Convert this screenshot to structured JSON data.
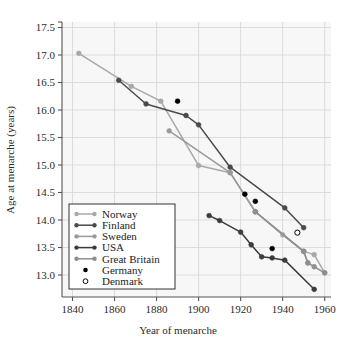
{
  "chart_data": {
    "type": "line",
    "title": "",
    "xlabel": "Year of menarche",
    "ylabel": "Age at menarche (years)",
    "xlim": [
      1835,
      1963
    ],
    "ylim": [
      12.6,
      17.6
    ],
    "xticks": [
      1840,
      1860,
      1880,
      1900,
      1920,
      1940,
      1960
    ],
    "yticks": [
      13.0,
      13.5,
      14.0,
      14.5,
      15.0,
      15.5,
      16.0,
      16.5,
      17.5
    ],
    "ytick_labels": [
      "13.0",
      "13.5",
      "14.0",
      "14.5",
      "15.0",
      "15.5",
      "16.0",
      "16.5",
      "17.0",
      "17.5"
    ],
    "ytick_values": [
      13.0,
      13.5,
      14.0,
      14.5,
      15.0,
      15.5,
      16.0,
      16.5,
      17.0,
      17.5
    ],
    "grid": true,
    "legend_position": "lower-left",
    "series": [
      {
        "name": "Norway",
        "color": "#a8a8a8",
        "marker": "filled-circle",
        "line": true,
        "points": [
          {
            "x": 1843,
            "y": 17.03
          },
          {
            "x": 1868,
            "y": 16.43
          },
          {
            "x": 1882,
            "y": 16.16
          },
          {
            "x": 1900,
            "y": 14.99
          },
          {
            "x": 1915,
            "y": 14.86
          },
          {
            "x": 1927,
            "y": 14.15
          },
          {
            "x": 1940,
            "y": 13.73
          },
          {
            "x": 1950,
            "y": 13.43
          },
          {
            "x": 1955,
            "y": 13.37
          },
          {
            "x": 1960,
            "y": 13.04
          }
        ]
      },
      {
        "name": "Finland",
        "color": "#4a4a4a",
        "marker": "filled-circle",
        "line": true,
        "points": [
          {
            "x": 1862,
            "y": 16.54
          },
          {
            "x": 1875,
            "y": 16.11
          },
          {
            "x": 1894,
            "y": 15.9
          },
          {
            "x": 1900,
            "y": 15.73
          },
          {
            "x": 1915,
            "y": 14.96
          },
          {
            "x": 1941,
            "y": 14.22
          },
          {
            "x": 1950,
            "y": 13.86
          }
        ]
      },
      {
        "name": "Sweden",
        "color": "#9a9a9a",
        "marker": "filled-circle",
        "line": true,
        "points": [
          {
            "x": 1886,
            "y": 15.62
          },
          {
            "x": 1915,
            "y": 14.86
          },
          {
            "x": 1927,
            "y": 14.15
          },
          {
            "x": 1950,
            "y": 13.43
          },
          {
            "x": 1952,
            "y": 13.22
          }
        ]
      },
      {
        "name": "USA",
        "color": "#3b3b3b",
        "marker": "filled-circle",
        "line": true,
        "points": [
          {
            "x": 1905,
            "y": 14.08
          },
          {
            "x": 1910,
            "y": 13.99
          },
          {
            "x": 1920,
            "y": 13.78
          },
          {
            "x": 1925,
            "y": 13.55
          },
          {
            "x": 1930,
            "y": 13.33
          },
          {
            "x": 1935,
            "y": 13.31
          },
          {
            "x": 1941,
            "y": 13.27
          },
          {
            "x": 1955,
            "y": 12.74
          }
        ]
      },
      {
        "name": "Great Britain",
        "color": "#8f8f8f",
        "marker": "filled-circle",
        "line": true,
        "points": [
          {
            "x": 1927,
            "y": 14.15
          },
          {
            "x": 1950,
            "y": 13.43
          },
          {
            "x": 1952,
            "y": 13.22
          },
          {
            "x": 1955,
            "y": 13.15
          },
          {
            "x": 1960,
            "y": 13.04
          }
        ]
      },
      {
        "name": "Germany",
        "color": "#000000",
        "marker": "filled-circle",
        "line": false,
        "points": [
          {
            "x": 1890,
            "y": 16.16
          },
          {
            "x": 1922,
            "y": 14.47
          },
          {
            "x": 1927,
            "y": 14.34
          },
          {
            "x": 1935,
            "y": 13.48
          }
        ]
      },
      {
        "name": "Denmark",
        "color": "#000000",
        "marker": "open-circle",
        "line": false,
        "points": [
          {
            "x": 1947,
            "y": 13.77
          }
        ]
      }
    ]
  },
  "legend": {
    "entries": [
      {
        "label": "Norway",
        "style": "line-marker",
        "color": "#a8a8a8"
      },
      {
        "label": "Finland",
        "style": "line-marker",
        "color": "#4a4a4a"
      },
      {
        "label": "Sweden",
        "style": "line-marker",
        "color": "#9a9a9a"
      },
      {
        "label": "USA",
        "style": "line-marker",
        "color": "#3b3b3b"
      },
      {
        "label": "Great Britain",
        "style": "line-marker",
        "color": "#8f8f8f"
      },
      {
        "label": "Germany",
        "style": "filled-dot",
        "color": "#000000"
      },
      {
        "label": "Denmark",
        "style": "open-dot",
        "color": "#000000"
      }
    ]
  },
  "colors": {
    "background": "#ffffff",
    "plot_background": "#f7f7f7",
    "grid": "#d8d8d8",
    "axis": "#555555",
    "text": "#2b2b2b"
  }
}
